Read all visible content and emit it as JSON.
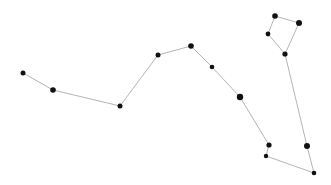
{
  "diagram": {
    "type": "constellation",
    "background": "#ffffff",
    "edge_color": "#b5b5b5",
    "star_color": "#111111",
    "stars": [
      {
        "id": "A",
        "x": 23,
        "y": 73,
        "r": 2.5
      },
      {
        "id": "B",
        "x": 53,
        "y": 90,
        "r": 2.8
      },
      {
        "id": "C",
        "x": 120,
        "y": 106,
        "r": 2.5
      },
      {
        "id": "D",
        "x": 158,
        "y": 55,
        "r": 2.5
      },
      {
        "id": "E",
        "x": 191,
        "y": 46,
        "r": 2.8
      },
      {
        "id": "F",
        "x": 212,
        "y": 67,
        "r": 2.3
      },
      {
        "id": "G",
        "x": 240,
        "y": 97,
        "r": 3.2
      },
      {
        "id": "H",
        "x": 269,
        "y": 145,
        "r": 2.6
      },
      {
        "id": "I",
        "x": 266,
        "y": 156,
        "r": 2.2
      },
      {
        "id": "J",
        "x": 314,
        "y": 173,
        "r": 2.3
      },
      {
        "id": "K",
        "x": 307,
        "y": 146,
        "r": 3.0
      },
      {
        "id": "L",
        "x": 285,
        "y": 54,
        "r": 2.6
      },
      {
        "id": "M",
        "x": 268,
        "y": 34,
        "r": 2.4
      },
      {
        "id": "N",
        "x": 275,
        "y": 16,
        "r": 2.8
      },
      {
        "id": "O",
        "x": 299,
        "y": 23,
        "r": 3.0
      }
    ],
    "edges": [
      [
        "A",
        "B"
      ],
      [
        "B",
        "C"
      ],
      [
        "C",
        "D"
      ],
      [
        "D",
        "E"
      ],
      [
        "E",
        "F"
      ],
      [
        "F",
        "G"
      ],
      [
        "G",
        "H"
      ],
      [
        "H",
        "I"
      ],
      [
        "I",
        "J"
      ],
      [
        "J",
        "K"
      ],
      [
        "K",
        "L"
      ],
      [
        "L",
        "M"
      ],
      [
        "M",
        "N"
      ],
      [
        "N",
        "O"
      ],
      [
        "O",
        "L"
      ]
    ]
  }
}
